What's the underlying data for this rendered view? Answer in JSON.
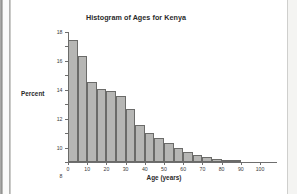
{
  "document": {
    "page_background": "#ffffff",
    "surround_background": "#f2f2f0"
  },
  "chart_data": {
    "type": "bar",
    "title": "Histogram of Ages for Kenya",
    "xlabel": "Age (years)",
    "ylabel": "Percent",
    "xlim": [
      0,
      100
    ],
    "ylim": [
      0,
      18
    ],
    "grid": false,
    "legend": null,
    "bin_width": 5,
    "bar_fill_color": "#b6b6b4",
    "bar_edge_color": "#6b6b69",
    "xticks": [
      0,
      10,
      20,
      30,
      40,
      50,
      60,
      70,
      80,
      90,
      100
    ],
    "xtick_labels": [
      "0",
      "10",
      "20",
      "30",
      "40",
      "50",
      "60",
      "70",
      "80",
      "90",
      "100"
    ],
    "yticks": [
      0,
      2,
      4,
      6,
      8,
      10,
      12,
      14,
      16,
      18
    ],
    "ytick_labels": [
      "0",
      "2",
      "4",
      "6",
      "8",
      "10",
      "12",
      "14",
      "16",
      "18"
    ],
    "bin_starts": [
      0,
      5,
      10,
      15,
      20,
      25,
      30,
      35,
      40,
      45,
      50,
      55,
      60,
      65,
      70,
      75,
      80,
      85
    ],
    "categories": [
      "0-5",
      "5-10",
      "10-15",
      "15-20",
      "20-25",
      "25-30",
      "30-35",
      "35-40",
      "40-45",
      "45-50",
      "50-55",
      "55-60",
      "60-65",
      "65-70",
      "70-75",
      "75-80",
      "80-85",
      "85-90"
    ],
    "values": [
      16.9,
      14.7,
      11.1,
      10.1,
      9.8,
      9.1,
      7.4,
      5.1,
      4.0,
      3.3,
      2.6,
      2.0,
      1.4,
      1.0,
      0.75,
      0.45,
      0.2,
      0.08
    ]
  }
}
